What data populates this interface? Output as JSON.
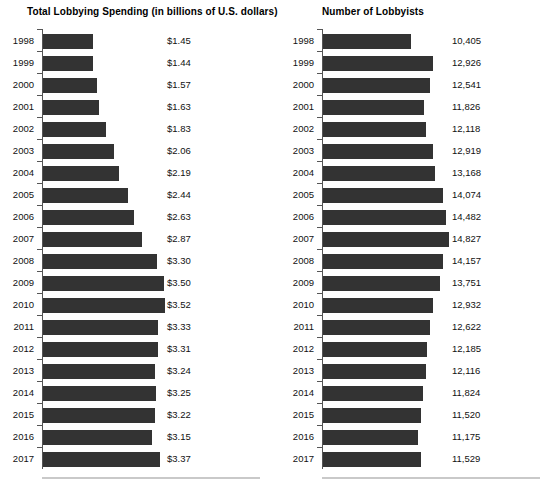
{
  "figure": {
    "width": 553,
    "height": 497,
    "background": "#ffffff",
    "bar_color": "#333333",
    "axis_color": "#555555",
    "rule_color": "#c9c9c9"
  },
  "panels": [
    {
      "key": "spending",
      "title": "Total Lobbying Spending (in billions of U.S. dollars)"
    },
    {
      "key": "lobbyists",
      "title": "Number of Lobbyists"
    }
  ],
  "chart_data": [
    {
      "type": "bar",
      "orientation": "horizontal",
      "title": "Total Lobbying Spending (in billions of U.S. dollars)",
      "xlabel": "",
      "ylabel": "",
      "grid": false,
      "legend": "none",
      "value_labels": true,
      "value_prefix": "$",
      "xlim": [
        0,
        3.52
      ],
      "categories": [
        "1998",
        "1999",
        "2000",
        "2001",
        "2002",
        "2003",
        "2004",
        "2005",
        "2006",
        "2007",
        "2008",
        "2009",
        "2010",
        "2011",
        "2012",
        "2013",
        "2014",
        "2015",
        "2016",
        "2017"
      ],
      "values": [
        1.45,
        1.44,
        1.57,
        1.63,
        1.83,
        2.06,
        2.19,
        2.44,
        2.63,
        2.87,
        3.3,
        3.5,
        3.52,
        3.33,
        3.31,
        3.24,
        3.25,
        3.22,
        3.15,
        3.37
      ],
      "labels": [
        "$1.45",
        "$1.44",
        "$1.57",
        "$1.63",
        "$1.83",
        "$2.06",
        "$2.19",
        "$2.44",
        "$2.63",
        "$2.87",
        "$3.30",
        "$3.50",
        "$3.52",
        "$3.33",
        "$3.31",
        "$3.24",
        "$3.25",
        "$3.22",
        "$3.15",
        "$3.37"
      ]
    },
    {
      "type": "bar",
      "orientation": "horizontal",
      "title": "Number of Lobbyists",
      "xlabel": "",
      "ylabel": "",
      "grid": false,
      "legend": "none",
      "value_labels": true,
      "value_prefix": "",
      "xlim": [
        0,
        14827
      ],
      "categories": [
        "1998",
        "1999",
        "2000",
        "2001",
        "2002",
        "2003",
        "2004",
        "2005",
        "2006",
        "2007",
        "2008",
        "2009",
        "2010",
        "2011",
        "2012",
        "2013",
        "2014",
        "2015",
        "2016",
        "2017"
      ],
      "values": [
        10405,
        12926,
        12541,
        11826,
        12118,
        12919,
        13168,
        14074,
        14482,
        14827,
        14157,
        13751,
        12932,
        12622,
        12185,
        12116,
        11824,
        11520,
        11175,
        11529
      ],
      "labels": [
        "10,405",
        "12,926",
        "12,541",
        "11,826",
        "12,118",
        "12,919",
        "13,168",
        "14,074",
        "14,482",
        "14,827",
        "14,157",
        "13,751",
        "12,932",
        "12,622",
        "12,185",
        "12,116",
        "11,824",
        "11,520",
        "11,175",
        "11,529"
      ]
    }
  ]
}
